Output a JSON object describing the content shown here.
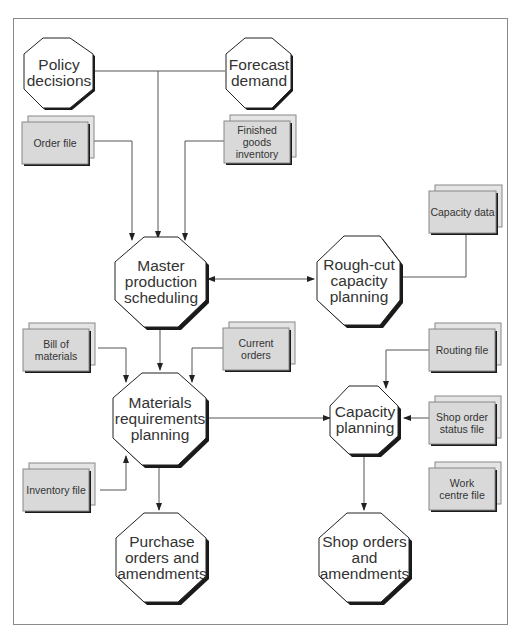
{
  "diagram": {
    "processes": {
      "policy": "Policy decisions",
      "forecast": "Forecast demand",
      "mps": "Master production scheduling",
      "rough_cut": "Rough-cut capacity planning",
      "mrp": "Materials requirements planning",
      "capacity": "Capacity planning",
      "purchase": "Purchase orders and amendments",
      "shop_orders": "Shop orders and amendments"
    },
    "files": {
      "order_file": "Order file",
      "finished_goods": "Finished goods inventory",
      "capacity_data": "Capacity data",
      "bom": "Bill of materials",
      "current_orders": "Current orders",
      "routing": "Routing file",
      "shop_order_status": "Shop order status file",
      "inventory": "Inventory file",
      "work_centre": "Work centre file"
    },
    "colors": {
      "file_fill": "#d9d9d9",
      "shadow": "#1a1a1a",
      "line": "#555555",
      "frame": "#8a8a8a"
    }
  }
}
